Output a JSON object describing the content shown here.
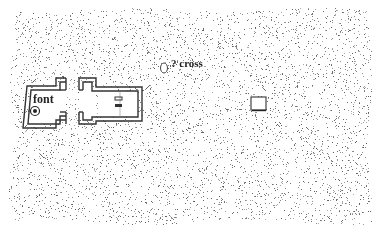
{
  "map": {
    "type": "stippled site plan",
    "labels": {
      "font": "font",
      "cross": "? cross"
    },
    "features": [
      {
        "name": "font",
        "symbol": "circled-dot",
        "x": 35,
        "y": 110
      },
      {
        "name": "possible cross",
        "symbol": "open-ellipse",
        "x": 164,
        "y": 68
      },
      {
        "name": "small rectangular feature",
        "symbol": "rectangle",
        "x": 251,
        "y": 97,
        "w": 15,
        "h": 13
      }
    ],
    "colors": {
      "ink": "#333333",
      "stipple": "#8a8a8a",
      "background": "#ffffff"
    }
  }
}
